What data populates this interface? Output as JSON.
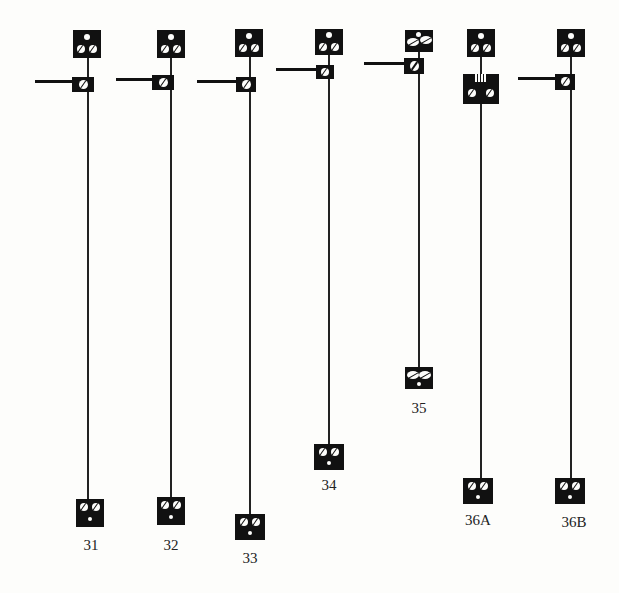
{
  "figure": {
    "type": "lever-switch-spring-assemblies",
    "colors": {
      "ink": "#111111",
      "paper": "#fdfdfb"
    },
    "items": [
      {
        "id": "31",
        "label": "31",
        "top_block": "dot-over-two-screws",
        "lever_block": "single-screw-with-arm",
        "bottom_block": "two-screws-over-dot"
      },
      {
        "id": "32",
        "label": "32",
        "top_block": "dot-over-two-screws",
        "lever_block": "single-screw-with-arm",
        "bottom_block": "two-screws-over-dot"
      },
      {
        "id": "33",
        "label": "33",
        "top_block": "dot-over-two-screws",
        "lever_block": "single-screw-with-arm",
        "bottom_block": "two-screws-over-dot"
      },
      {
        "id": "34",
        "label": "34",
        "top_block": "dot-over-two-screws",
        "lever_block": "single-screw-with-arm",
        "bottom_block": "two-screws-over-dot"
      },
      {
        "id": "35",
        "label": "35",
        "top_block": "dot-between-two-leaves",
        "lever_block": "single-screw-with-arm",
        "bottom_block": "two-leaves-over-dot"
      },
      {
        "id": "36A",
        "label": "36A",
        "top_block": "dot-over-two-screws",
        "lever_block": "grille-over-two-screws",
        "bottom_block": "two-screws-over-dot"
      },
      {
        "id": "36B",
        "label": "36B",
        "top_block": "dot-over-two-screws",
        "lever_block": "single-screw-with-arm",
        "bottom_block": "two-screws-over-dot"
      }
    ]
  }
}
